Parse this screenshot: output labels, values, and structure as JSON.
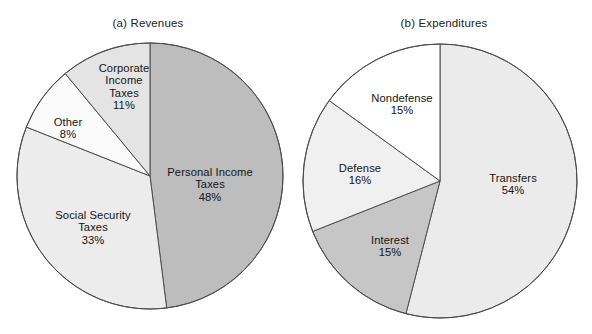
{
  "figure": {
    "background_color": "#ffffff",
    "outline_color": "#4d4d4d"
  },
  "panels": [
    {
      "id": "revenues",
      "title": "(a) Revenues"
    },
    {
      "id": "expenditures",
      "title": "(b) Expenditures"
    }
  ],
  "chart_data": [
    {
      "type": "pie",
      "title": "(a) Revenues",
      "labels": [
        "Personal Income Taxes",
        "Social Security Taxes",
        "Other",
        "Corporate Income Taxes"
      ],
      "values": [
        48,
        33,
        8,
        11
      ],
      "value_labels": [
        "48%",
        "33%",
        "8%",
        "11%"
      ],
      "colors": [
        "#bdbdbd",
        "#ececec",
        "#fbfbfb",
        "#e4e4e4"
      ],
      "start_angle_deg": 0,
      "direction": "clockwise",
      "legend": "none",
      "slices": [
        {
          "name": "Personal Income Taxes",
          "percent": 48,
          "percent_label": "48%",
          "label_lines": [
            "Personal Income",
            "Taxes"
          ],
          "color": "#bdbdbd",
          "start_deg": 0,
          "end_deg": 172.8,
          "label_x": 210,
          "label_y": 185
        },
        {
          "name": "Social Security Taxes",
          "percent": 33,
          "percent_label": "33%",
          "label_lines": [
            "Social Security",
            "Taxes"
          ],
          "color": "#ececec",
          "start_deg": 172.8,
          "end_deg": 291.6,
          "label_x": 93,
          "label_y": 228
        },
        {
          "name": "Other",
          "percent": 8,
          "percent_label": "8%",
          "label_lines": [
            "Other"
          ],
          "color": "#fbfbfb",
          "start_deg": 291.6,
          "end_deg": 320.4,
          "label_x": 68,
          "label_y": 128
        },
        {
          "name": "Corporate Income Taxes",
          "percent": 11,
          "percent_label": "11%",
          "label_lines": [
            "Corporate",
            "Income",
            "Taxes"
          ],
          "color": "#e4e4e4",
          "start_deg": 320.4,
          "end_deg": 360,
          "label_x": 124,
          "label_y": 87
        }
      ]
    },
    {
      "type": "pie",
      "title": "(b) Expenditures",
      "labels": [
        "Transfers",
        "Interest",
        "Defense",
        "Nondefense"
      ],
      "values": [
        54,
        15,
        16,
        15
      ],
      "value_labels": [
        "54%",
        "15%",
        "16%",
        "15%"
      ],
      "colors": [
        "#ebebeb",
        "#c6c6c6",
        "#f0f0f0",
        "#ffffff"
      ],
      "start_angle_deg": 0,
      "direction": "clockwise",
      "legend": "none",
      "slices": [
        {
          "name": "Transfers",
          "percent": 54,
          "percent_label": "54%",
          "label_lines": [
            "Transfers"
          ],
          "color": "#ebebeb",
          "start_deg": 0,
          "end_deg": 194.4,
          "label_x": 217,
          "label_y": 184
        },
        {
          "name": "Interest",
          "percent": 15,
          "percent_label": "15%",
          "label_lines": [
            "Interest"
          ],
          "color": "#c6c6c6",
          "start_deg": 194.4,
          "end_deg": 248.4,
          "label_x": 94,
          "label_y": 246
        },
        {
          "name": "Defense",
          "percent": 16,
          "percent_label": "16%",
          "label_lines": [
            "Defense"
          ],
          "color": "#f0f0f0",
          "start_deg": 248.4,
          "end_deg": 306,
          "label_x": 64,
          "label_y": 174
        },
        {
          "name": "Nondefense",
          "percent": 15,
          "percent_label": "15%",
          "label_lines": [
            "Nondefense"
          ],
          "color": "#ffffff",
          "start_deg": 306,
          "end_deg": 360,
          "label_x": 106,
          "label_y": 104
        }
      ]
    }
  ],
  "geometry": {
    "pie_a": {
      "cx": 150,
      "cy": 176,
      "r": 133
    },
    "pie_b": {
      "cx": 144,
      "cy": 181,
      "r": 137
    }
  }
}
